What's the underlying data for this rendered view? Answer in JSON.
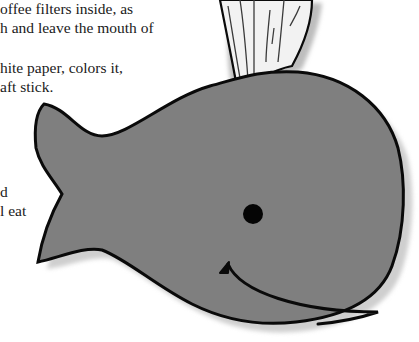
{
  "document": {
    "text_lines": [
      {
        "text": "offee filters inside, as",
        "x": 0,
        "y": -1
      },
      {
        "text": "h and leave the mouth of",
        "x": 0,
        "y": 18
      },
      {
        "text": "hite paper, colors it,",
        "x": 0,
        "y": 58
      },
      {
        "text": "aft stick.",
        "x": 0,
        "y": 77
      },
      {
        "text": "d",
        "x": 0,
        "y": 182
      },
      {
        "text": "l eat",
        "x": 0,
        "y": 201
      }
    ]
  },
  "illustration": {
    "subject": "whale-with-water-spout",
    "colors": {
      "body": "#7f7f7f",
      "outline": "#0a0a0a",
      "spout": "#f2f2f2",
      "spout_lines": "#3a3a3a",
      "eye": "#050505",
      "shadow": "#bdbdbd"
    }
  }
}
